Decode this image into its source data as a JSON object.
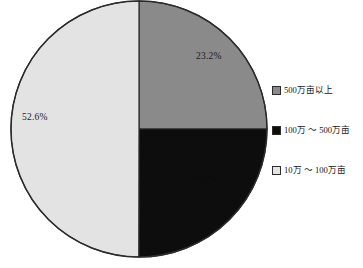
{
  "chart_data": {
    "type": "pie",
    "title": "",
    "subtitle": "",
    "xlabel": "",
    "ylabel": "",
    "grid": false,
    "legend_position": "right",
    "start_angle_deg": 0,
    "direction": "clockwise",
    "categories": [
      "500万亩以上",
      "100万 ～ 500万亩",
      "10万 ～ 100万亩"
    ],
    "values": [
      23.2,
      24.2,
      52.6
    ],
    "value_unit": "%",
    "data_labels": [
      "23.2%",
      "24.2%",
      "52.6%"
    ],
    "colors": [
      "#8a8a8a",
      "#0d0d0d",
      "#e3e3e3"
    ],
    "slices": [
      {
        "name": "500万亩以上",
        "value": 23.2,
        "label": "23.2%",
        "color": "#8a8a8a",
        "start_deg": 0,
        "end_deg": 90,
        "label_visible": true
      },
      {
        "name": "100万 ～ 500万亩",
        "value": 24.2,
        "label": "24.2%",
        "color": "#0d0d0d",
        "start_deg": 90,
        "end_deg": 180.1,
        "label_visible": false
      },
      {
        "name": "10万 ～ 100万亩",
        "value": 52.6,
        "label": "52.6%",
        "color": "#e3e3e3",
        "start_deg": 180.1,
        "end_deg": 360,
        "label_visible": true
      }
    ]
  },
  "pie": {
    "center_x": 139,
    "center_y": 129,
    "radius": 128,
    "outline_color": "#2b2b2b",
    "label_gray": "23.2%",
    "label_light": "52.6%",
    "label_black": "24.2%"
  },
  "legend": {
    "items": [
      {
        "label": "500万亩以上",
        "color": "#8a8a8a"
      },
      {
        "label": "100万 ～ 500万亩",
        "color": "#0d0d0d"
      },
      {
        "label": "10万 ～ 100万亩",
        "color": "#e3e3e3"
      }
    ]
  }
}
